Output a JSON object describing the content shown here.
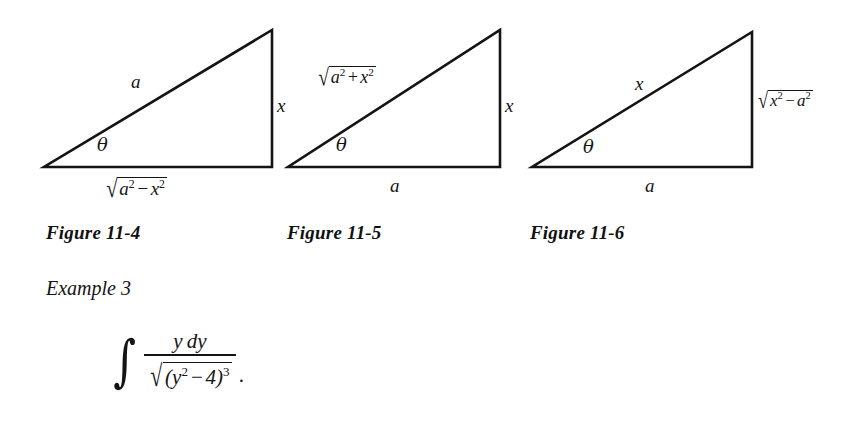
{
  "page": {
    "background_color": "#ffffff",
    "ink_color": "#141414"
  },
  "figures": [
    {
      "id": "figure-11-4",
      "caption": "Figure 11-4",
      "angle_label": "θ",
      "hypotenuse_label": {
        "text": "a",
        "kind": "variable"
      },
      "vertical_label": {
        "text": "x",
        "kind": "variable"
      },
      "base_label": {
        "kind": "radical",
        "radicand_parts": [
          "a",
          "2",
          "−",
          "x",
          "2"
        ],
        "text": "√(a² − x²)"
      }
    },
    {
      "id": "figure-11-5",
      "caption": "Figure 11-5",
      "angle_label": "θ",
      "hypotenuse_label": {
        "kind": "radical",
        "radicand_parts": [
          "a",
          "2",
          "+",
          "x",
          "2"
        ],
        "text": "√(a² + x²)"
      },
      "vertical_label": {
        "text": "x",
        "kind": "variable"
      },
      "base_label": {
        "text": "a",
        "kind": "variable"
      }
    },
    {
      "id": "figure-11-6",
      "caption": "Figure 11-6",
      "angle_label": "θ",
      "hypotenuse_label": {
        "text": "x",
        "kind": "variable"
      },
      "vertical_label": {
        "kind": "radical",
        "radicand_parts": [
          "x",
          "2",
          "−",
          "a",
          "2"
        ],
        "text": "√(x² − a²)"
      },
      "base_label": {
        "text": "a",
        "kind": "variable"
      }
    }
  ],
  "example": {
    "label": "Example 3",
    "integral": {
      "sign": "∫",
      "numerator": "y dy",
      "numerator_parts": {
        "variable": "y",
        "differential": "dy"
      },
      "denominator": {
        "kind": "radical",
        "text": "√((y² − 4)³)",
        "open_paren": "(",
        "base_variable": "y",
        "base_exponent": "2",
        "operator": "−",
        "constant": "4",
        "close_paren": ")",
        "outer_exponent": "3"
      },
      "trailing_punctuation": "."
    }
  }
}
